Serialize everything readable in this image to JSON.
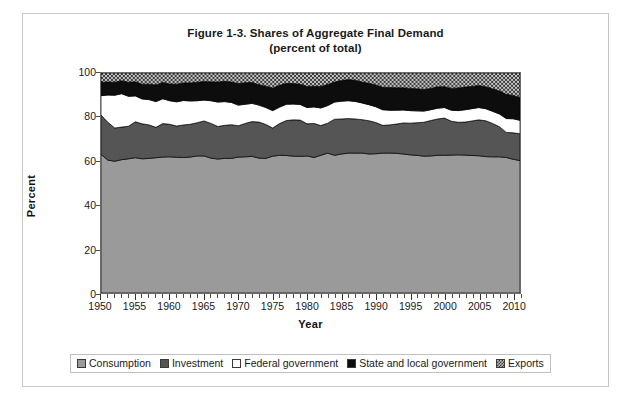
{
  "figure": {
    "title_line1": "Figure 1-3. Shares of Aggregate Final Demand",
    "title_line2": "(percent of total)"
  },
  "axes": {
    "y_title": "Percent",
    "x_title": "Year",
    "y_ticks": [
      "0",
      "20",
      "40",
      "60",
      "80",
      "100"
    ],
    "x_ticks": [
      "1950",
      "1955",
      "1960",
      "1965",
      "1970",
      "1975",
      "1980",
      "1985",
      "1990",
      "1995",
      "2000",
      "2005",
      "2010"
    ]
  },
  "legend": {
    "items": [
      {
        "label": "Consumption",
        "swatch": "consumption-swatch-icon",
        "color": "#9a9a9a"
      },
      {
        "label": "Investment",
        "swatch": "investment-swatch-icon",
        "color": "#555555"
      },
      {
        "label": "Federal government",
        "swatch": "federal-government-swatch-icon",
        "color": "#ffffff"
      },
      {
        "label": "State and local government",
        "swatch": "state-and-local-government-swatch-icon",
        "color": "#0d0d0d"
      },
      {
        "label": "Exports",
        "swatch": "exports-swatch-icon",
        "color": "#b9b9b9"
      }
    ]
  },
  "chart_data": {
    "type": "area",
    "stacked": true,
    "percent_of_total": true,
    "title": "Figure 1-3. Shares of Aggregate Final Demand (percent of total)",
    "xlabel": "Year",
    "ylabel": "Percent",
    "xlim": [
      1950,
      2011
    ],
    "ylim": [
      0,
      100
    ],
    "grid": false,
    "legend_position": "bottom",
    "x": [
      1950,
      1951,
      1952,
      1953,
      1954,
      1955,
      1956,
      1957,
      1958,
      1959,
      1960,
      1961,
      1962,
      1963,
      1964,
      1965,
      1966,
      1967,
      1968,
      1969,
      1970,
      1971,
      1972,
      1973,
      1974,
      1975,
      1976,
      1977,
      1978,
      1979,
      1980,
      1981,
      1982,
      1983,
      1984,
      1985,
      1986,
      1987,
      1988,
      1989,
      1990,
      1991,
      1992,
      1993,
      1994,
      1995,
      1996,
      1997,
      1998,
      1999,
      2000,
      2001,
      2002,
      2003,
      2004,
      2005,
      2006,
      2007,
      2008,
      2009,
      2010,
      2011
    ],
    "series": [
      {
        "name": "Consumption",
        "color": "#9a9a9a",
        "pattern": "solid",
        "values": [
          63.0,
          60.4,
          59.9,
          60.6,
          61.0,
          61.5,
          61.0,
          61.2,
          61.5,
          61.8,
          61.9,
          61.7,
          61.6,
          61.8,
          62.3,
          62.3,
          61.3,
          60.9,
          61.2,
          61.2,
          61.8,
          61.9,
          62.1,
          61.3,
          61.2,
          62.2,
          62.6,
          62.5,
          62.2,
          62.1,
          62.3,
          61.6,
          62.6,
          63.6,
          62.6,
          63.2,
          63.6,
          63.6,
          63.6,
          63.2,
          63.3,
          63.6,
          63.6,
          63.5,
          63.2,
          62.8,
          62.6,
          62.2,
          62.3,
          62.6,
          62.6,
          62.7,
          62.8,
          62.7,
          62.5,
          62.4,
          62.0,
          61.9,
          61.9,
          61.6,
          60.8,
          60.2
        ]
      },
      {
        "name": "Investment",
        "color": "#555555",
        "pattern": "solid",
        "values": [
          17.9,
          17.2,
          15.1,
          14.8,
          14.8,
          16.3,
          15.9,
          15.2,
          13.8,
          15.2,
          14.8,
          14.2,
          14.8,
          14.9,
          15.1,
          15.9,
          15.8,
          14.8,
          15.0,
          15.3,
          14.2,
          15.2,
          15.8,
          16.4,
          15.4,
          12.8,
          14.4,
          15.9,
          16.5,
          16.5,
          14.6,
          15.5,
          13.5,
          13.6,
          16.4,
          15.9,
          15.7,
          15.5,
          15.2,
          15.1,
          14.2,
          12.6,
          12.8,
          13.3,
          14.1,
          14.4,
          14.8,
          15.4,
          16.1,
          16.5,
          16.9,
          15.4,
          14.8,
          15.0,
          15.7,
          16.3,
          16.3,
          15.2,
          13.7,
          11.4,
          12.0,
          12.2
        ]
      },
      {
        "name": "Federal government",
        "color": "#ffffff",
        "pattern": "solid",
        "values": [
          8.8,
          12.4,
          14.9,
          15.2,
          13.6,
          11.8,
          11.3,
          11.5,
          11.7,
          11.3,
          10.7,
          11.0,
          11.1,
          10.6,
          10.0,
          9.5,
          10.3,
          11.1,
          10.8,
          10.1,
          9.4,
          8.7,
          8.3,
          7.7,
          7.7,
          7.9,
          7.5,
          7.4,
          7.2,
          7.1,
          7.4,
          7.5,
          8.0,
          8.0,
          7.8,
          8.1,
          8.1,
          8.0,
          7.6,
          7.3,
          7.2,
          7.1,
          6.7,
          6.3,
          5.9,
          5.7,
          5.4,
          5.1,
          4.9,
          4.9,
          4.8,
          5.0,
          5.3,
          5.6,
          5.6,
          5.6,
          5.5,
          5.5,
          5.8,
          6.3,
          6.4,
          6.1
        ]
      },
      {
        "name": "State and local government",
        "color": "#0d0d0d",
        "pattern": "solid",
        "values": [
          6.1,
          5.9,
          5.9,
          5.9,
          6.4,
          6.4,
          6.7,
          7.0,
          7.6,
          7.4,
          7.6,
          8.0,
          8.0,
          8.2,
          8.4,
          8.4,
          8.6,
          9.1,
          9.2,
          9.3,
          9.8,
          9.8,
          9.5,
          9.3,
          9.7,
          10.3,
          9.9,
          9.5,
          9.3,
          9.2,
          9.6,
          9.4,
          9.8,
          9.6,
          9.1,
          9.4,
          9.6,
          9.6,
          9.5,
          9.7,
          9.9,
          10.2,
          10.3,
          10.2,
          10.1,
          10.1,
          10.0,
          9.8,
          9.7,
          9.7,
          9.5,
          9.9,
          10.3,
          10.3,
          10.1,
          10.0,
          10.0,
          10.2,
          10.4,
          11.0,
          10.6,
          10.3
        ]
      },
      {
        "name": "Exports",
        "color": "#b9b9b9",
        "pattern": "checker",
        "values": [
          4.2,
          4.1,
          4.2,
          3.5,
          4.2,
          4.0,
          5.1,
          5.1,
          5.4,
          4.3,
          5.0,
          5.1,
          4.5,
          4.5,
          4.2,
          3.9,
          4.0,
          4.1,
          3.8,
          4.1,
          4.8,
          4.4,
          4.3,
          5.3,
          6.0,
          6.8,
          5.6,
          4.7,
          4.8,
          5.1,
          6.1,
          6.0,
          6.1,
          5.2,
          4.1,
          3.4,
          3.0,
          3.3,
          4.1,
          4.7,
          5.4,
          6.5,
          6.6,
          6.7,
          6.7,
          7.0,
          7.2,
          7.5,
          7.0,
          6.3,
          6.2,
          7.0,
          6.8,
          6.4,
          6.1,
          5.7,
          6.2,
          7.2,
          8.2,
          9.7,
          10.2,
          11.2
        ]
      }
    ]
  }
}
